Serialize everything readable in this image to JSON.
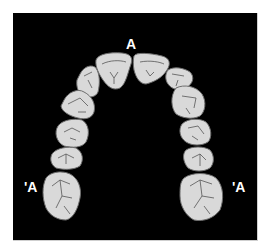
{
  "diagram": {
    "type": "dental-arch-occlusal-view",
    "labels": {
      "top": "A",
      "left": "'A",
      "right": "'A"
    },
    "colors": {
      "background": "#000000",
      "tooth_fill": "#d9d9d9",
      "fissure_line": "#555555",
      "halo_outline": "#6e6e6e",
      "label_text": "#ffffff"
    },
    "teeth": [
      {
        "id": "left-central-incisor",
        "side": "left"
      },
      {
        "id": "right-central-incisor",
        "side": "right"
      },
      {
        "id": "left-lateral-incisor",
        "side": "left"
      },
      {
        "id": "right-lateral-incisor",
        "side": "right"
      },
      {
        "id": "left-canine",
        "side": "left"
      },
      {
        "id": "right-canine",
        "side": "right"
      },
      {
        "id": "left-first-premolar",
        "side": "left"
      },
      {
        "id": "right-first-premolar",
        "side": "right"
      },
      {
        "id": "left-second-premolar",
        "side": "left"
      },
      {
        "id": "right-second-premolar",
        "side": "right"
      },
      {
        "id": "left-first-molar",
        "side": "left"
      },
      {
        "id": "right-first-molar",
        "side": "right"
      }
    ]
  }
}
